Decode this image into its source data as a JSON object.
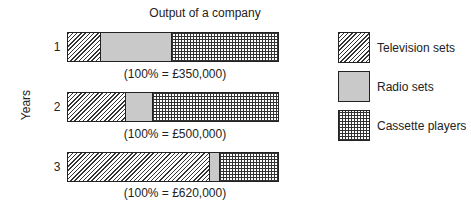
{
  "chart_data": {
    "type": "bar",
    "orientation": "horizontal",
    "stacked": true,
    "percent_stacked": true,
    "title": "Output of a company",
    "xlabel": "",
    "ylabel": "Years",
    "categories": [
      "1",
      "2",
      "3"
    ],
    "totals": [
      "(100% = £350,000)",
      "(100% = £500,000)",
      "(100% = £620,000)"
    ],
    "series": [
      {
        "name": "Television sets",
        "pattern": "diagonal-hatch",
        "values": [
          15,
          27,
          67
        ]
      },
      {
        "name": "Radio sets",
        "pattern": "dotted",
        "values": [
          34,
          13,
          5
        ]
      },
      {
        "name": "Cassette players",
        "pattern": "cross-hatch",
        "values": [
          51,
          60,
          28
        ]
      }
    ],
    "xlim": [
      0,
      100
    ],
    "grid": false,
    "legend_position": "right"
  },
  "title": "Output of a company",
  "ylabel": "Years",
  "rows": [
    {
      "label": "1",
      "caption": "(100% = £350,000)"
    },
    {
      "label": "2",
      "caption": "(100% = £500,000)"
    },
    {
      "label": "3",
      "caption": "(100% = £620,000)"
    }
  ],
  "legend": [
    {
      "label": "Television sets"
    },
    {
      "label": "Radio sets"
    },
    {
      "label": "Cassette players"
    }
  ]
}
